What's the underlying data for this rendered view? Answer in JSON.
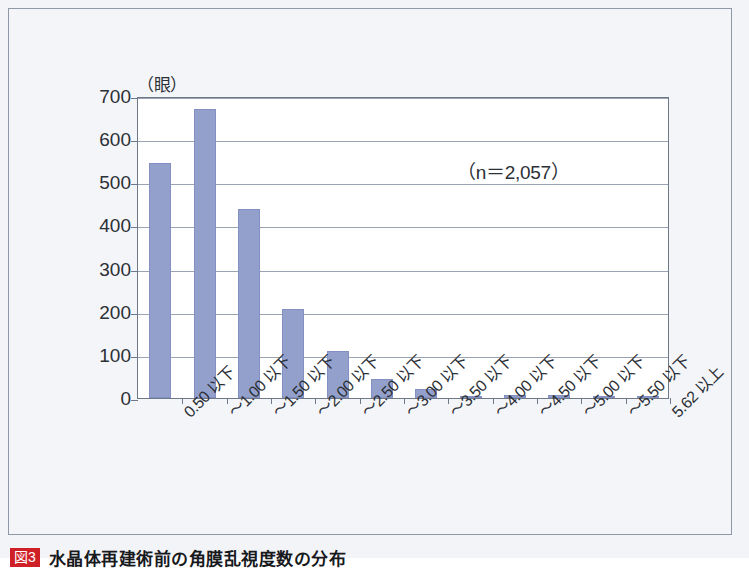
{
  "figure": {
    "y_unit_label": "（眼）",
    "sample_note": "（n＝2,057）",
    "caption_tag": "図3",
    "caption_text": "水晶体再建術前の角膜乱視度数の分布"
  },
  "colors": {
    "bar_fill": "#93a0cc",
    "bar_stroke": "#8490c2",
    "gridline": "#9aa3b2",
    "plot_border": "#6f7888",
    "frame_border": "#8e98a8",
    "paper": "#f3f4f7",
    "plot_background": "#ffffff",
    "text": "#2b2f36",
    "caption_tag_background": "#cf2027"
  },
  "chart_data": {
    "type": "bar",
    "title": "水晶体再建術前の角膜乱視度数の分布",
    "xlabel": "",
    "ylabel": "（眼）",
    "ylim": [
      0,
      700
    ],
    "ytick_step": 100,
    "yticks": [
      0,
      100,
      200,
      300,
      400,
      500,
      600,
      700
    ],
    "ytick_labels": [
      "0",
      "100",
      "200",
      "300",
      "400",
      "500",
      "600",
      "700"
    ],
    "grid": true,
    "legend": "none",
    "annotations": [
      "（n＝2,057）"
    ],
    "sample_size": 2057,
    "categories": [
      "0.50 以下",
      "～1.00 以下",
      "～1.50 以下",
      "～2.00 以下",
      "～2.50 以下",
      "～3.00 以下",
      "～3.50 以下",
      "～4.00 以下",
      "～4.50 以下",
      "～5.00 以下",
      "～5.50 以下",
      "5.62 以上"
    ],
    "values": [
      545,
      670,
      437,
      207,
      108,
      45,
      22,
      4,
      8,
      8,
      2,
      1
    ]
  }
}
